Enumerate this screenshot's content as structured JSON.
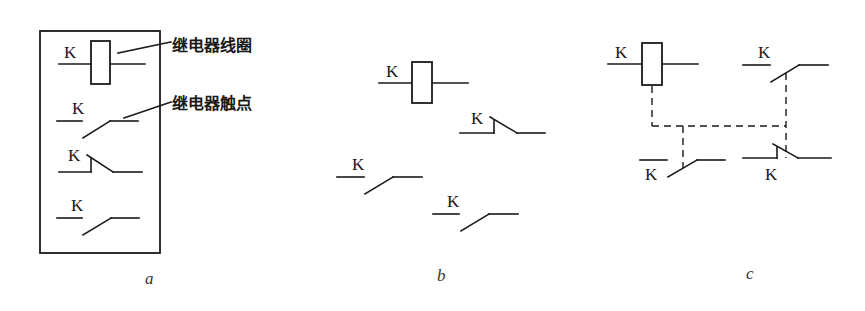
{
  "figure": {
    "panels": [
      {
        "id": "a",
        "caption": "a",
        "coil_label": "K",
        "annotations": {
          "coil": "继电器线圈",
          "contact": "继电器触点"
        },
        "contacts": [
          {
            "type": "normally-open",
            "label": "K"
          },
          {
            "type": "normally-closed",
            "label": "K"
          },
          {
            "type": "normally-open",
            "label": "K"
          }
        ]
      },
      {
        "id": "b",
        "caption": "b",
        "coil_label": "K",
        "contacts": [
          {
            "type": "normally-closed",
            "label": "K"
          },
          {
            "type": "normally-open",
            "label": "K"
          },
          {
            "type": "normally-open",
            "label": "K"
          }
        ]
      },
      {
        "id": "c",
        "caption": "c",
        "coil_label": "K",
        "contacts": [
          {
            "type": "normally-open",
            "label": "K"
          },
          {
            "type": "normally-open",
            "label": "K"
          },
          {
            "type": "normally-closed",
            "label": "K"
          }
        ],
        "mechanical_linkage": "dashed"
      }
    ],
    "colors": {
      "ink": "#1a1a1a",
      "background": "#ffffff"
    }
  }
}
